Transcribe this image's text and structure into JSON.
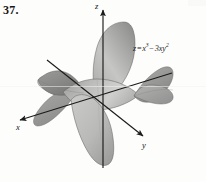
{
  "figure": {
    "problem_number": "37.",
    "type": "3d-surface-plot",
    "equation": {
      "lhs": "z",
      "relation": "=",
      "term1_base": "x",
      "term1_exp": "3",
      "operator": "−",
      "term2_coef": "3",
      "term2_base": "xy",
      "term2_exp": "2",
      "plain": "z = x³ − 3xy²"
    },
    "axes": [
      {
        "name": "x-axis",
        "label": "x",
        "direction": "down-left",
        "arrow": true
      },
      {
        "name": "y-axis",
        "label": "y",
        "direction": "down-right",
        "arrow": true
      },
      {
        "name": "z-axis",
        "label": "z",
        "direction": "up",
        "arrow": true
      }
    ],
    "colors": {
      "background": "#fdfdfc",
      "axis_line": "#1b1b1b",
      "surface_light": "#d8d8d6",
      "surface_mid": "#b0b0ae",
      "surface_dark": "#888886",
      "surface_darkest": "#6d6d6b",
      "outline": "#5c5c5a",
      "text": "#161616"
    }
  }
}
